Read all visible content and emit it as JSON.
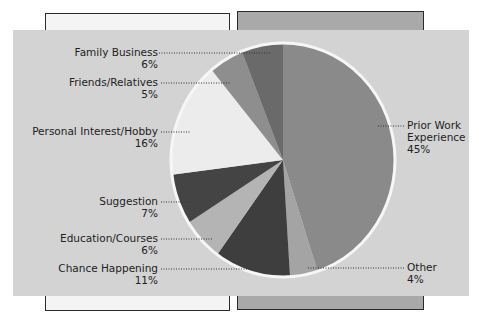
{
  "chart_data": {
    "type": "pie",
    "title": "",
    "start_angle": "12 o'clock",
    "direction": "clockwise",
    "slices": [
      {
        "label": "Prior Work Experience",
        "value": 45,
        "color": "#8a8a8a"
      },
      {
        "label": "Other",
        "value": 4,
        "color": "#a4a4a4"
      },
      {
        "label": "Chance Happening",
        "value": 11,
        "color": "#3e3e3e"
      },
      {
        "label": "Education/Courses",
        "value": 6,
        "color": "#b4b4b4"
      },
      {
        "label": "Suggestion",
        "value": 7,
        "color": "#444444"
      },
      {
        "label": "Personal Interest/Hobby",
        "value": 16,
        "color": "#ececec"
      },
      {
        "label": "Friends/Relatives",
        "value": 5,
        "color": "#8e8e8e"
      },
      {
        "label": "Family Business",
        "value": 6,
        "color": "#6a6a6a"
      }
    ],
    "categories": [
      "Prior Work Experience",
      "Other",
      "Chance Happening",
      "Education/Courses",
      "Suggestion",
      "Personal Interest/Hobby",
      "Friends/Relatives",
      "Family Business"
    ],
    "values": [
      45,
      4,
      11,
      6,
      7,
      16,
      5,
      6
    ],
    "unit": "%"
  },
  "labels": {
    "family": {
      "name": "Family Business",
      "pct": "6%"
    },
    "friends": {
      "name": "Friends/Relatives",
      "pct": "5%"
    },
    "personal": {
      "name": "Personal Interest/Hobby",
      "pct": "16%"
    },
    "suggestion": {
      "name": "Suggestion",
      "pct": "7%"
    },
    "education": {
      "name": "Education/Courses",
      "pct": "6%"
    },
    "chance": {
      "name": "Chance Happening",
      "pct": "11%"
    },
    "prior": {
      "line1": "Prior Work",
      "line2": "Experience",
      "pct": "45%"
    },
    "other": {
      "name": "Other",
      "pct": "4%"
    }
  },
  "colors": {
    "panel": "#d3d3d3",
    "left_box": "#f4f4f4",
    "right_box": "#a9a9a9",
    "pie_border": "#f6f6f6"
  }
}
